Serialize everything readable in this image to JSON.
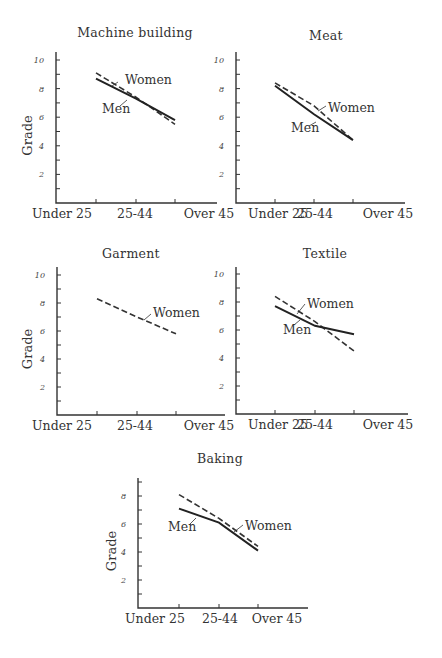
{
  "chart_data": [
    {
      "type": "line",
      "title": "Machine building",
      "xlabel": "",
      "ylabel": "Grade",
      "categories": [
        "Under 25",
        "25-44",
        "Over 45"
      ],
      "ylim": [
        0,
        10.5
      ],
      "yticks_labeled": [
        2,
        4,
        6,
        8,
        10
      ],
      "grid": false,
      "series": [
        {
          "name": "Women",
          "style": "dashed",
          "values": [
            9.1,
            7.4,
            5.5
          ]
        },
        {
          "name": "Men",
          "style": "solid",
          "values": [
            8.7,
            7.3,
            5.8
          ]
        }
      ]
    },
    {
      "type": "line",
      "title": "Meat",
      "xlabel": "",
      "ylabel": "",
      "categories": [
        "Under 25",
        "25-44",
        "Over 45"
      ],
      "ylim": [
        0,
        10.5
      ],
      "yticks_labeled": [
        2,
        4,
        6,
        8,
        10
      ],
      "grid": false,
      "series": [
        {
          "name": "Women",
          "style": "dashed",
          "values": [
            8.4,
            6.8,
            4.4
          ]
        },
        {
          "name": "Men",
          "style": "solid",
          "values": [
            8.2,
            6.2,
            4.4
          ]
        }
      ]
    },
    {
      "type": "line",
      "title": "Garment",
      "xlabel": "",
      "ylabel": "Grade",
      "categories": [
        "Under 25",
        "25-44",
        "Over 45"
      ],
      "ylim": [
        0,
        10.5
      ],
      "yticks_labeled": [
        2,
        4,
        6,
        8,
        10
      ],
      "grid": false,
      "series": [
        {
          "name": "Women",
          "style": "dashed",
          "values": [
            8.3,
            7.0,
            5.8
          ]
        }
      ]
    },
    {
      "type": "line",
      "title": "Textile",
      "xlabel": "",
      "ylabel": "",
      "categories": [
        "Under 25",
        "25-44",
        "Over 45"
      ],
      "ylim": [
        0,
        10.5
      ],
      "yticks_labeled": [
        2,
        4,
        6,
        8,
        10
      ],
      "grid": false,
      "series": [
        {
          "name": "Women",
          "style": "dashed",
          "values": [
            8.4,
            6.6,
            4.5
          ]
        },
        {
          "name": "Men",
          "style": "solid",
          "values": [
            7.7,
            6.3,
            5.7
          ]
        }
      ]
    },
    {
      "type": "line",
      "title": "Baking",
      "xlabel": "",
      "ylabel": "Grade",
      "categories": [
        "Under 25",
        "25-44",
        "Over 45"
      ],
      "ylim": [
        0,
        9.2
      ],
      "yticks_labeled": [
        2,
        4,
        6,
        8
      ],
      "grid": false,
      "series": [
        {
          "name": "Women",
          "style": "dashed",
          "values": [
            8.1,
            6.4,
            4.4
          ]
        },
        {
          "name": "Men",
          "style": "solid",
          "values": [
            7.1,
            6.1,
            4.1
          ]
        }
      ]
    }
  ],
  "layout": [
    {
      "x0": 56,
      "y0": 203,
      "xend": 217,
      "ytop": 52,
      "ppu": 14.3,
      "tickx": [
        96,
        136,
        175
      ],
      "xlabelx": [
        62,
        135,
        209
      ],
      "title_x": 135,
      "title_y": 37,
      "show_ylabel": true,
      "ylabel_x": 32,
      "labels": [
        {
          "series": "Women",
          "x": 125,
          "y": 84,
          "lx1": 112,
          "ly1": 86,
          "lx2": 118,
          "ly2": 82
        },
        {
          "series": "Men",
          "x": 102,
          "y": 113,
          "lx1": 120,
          "ly1": 106,
          "lx2": 127,
          "ly2": 100
        }
      ]
    },
    {
      "x0": 236,
      "y0": 203,
      "xend": 405,
      "ytop": 52,
      "ppu": 14.3,
      "tickx": [
        275,
        314,
        353
      ],
      "xlabelx": [
        278,
        315,
        388
      ],
      "title_x": 326,
      "title_y": 40,
      "show_ylabel": false,
      "labels": [
        {
          "series": "Women",
          "x": 328,
          "y": 112,
          "lx1": 318,
          "ly1": 111,
          "lx2": 326,
          "ly2": 106
        },
        {
          "series": "Men",
          "x": 291,
          "y": 132,
          "lx1": 309,
          "ly1": 126,
          "lx2": 316,
          "ly2": 122
        }
      ]
    },
    {
      "x0": 57,
      "y0": 415,
      "xend": 225,
      "ytop": 267,
      "ppu": 14.0,
      "tickx": [
        97,
        137,
        176
      ],
      "xlabelx": [
        62,
        135,
        209
      ],
      "title_x": 131,
      "title_y": 258,
      "show_ylabel": true,
      "ylabel_x": 32,
      "labels": [
        {
          "series": "Women",
          "x": 153,
          "y": 317,
          "lx1": 144,
          "ly1": 320,
          "lx2": 151,
          "ly2": 314
        }
      ]
    },
    {
      "x0": 236,
      "y0": 414,
      "xend": 408,
      "ytop": 267,
      "ppu": 14.0,
      "tickx": [
        275,
        315,
        354
      ],
      "xlabelx": [
        278,
        315,
        388
      ],
      "title_x": 325,
      "title_y": 258,
      "show_ylabel": false,
      "labels": [
        {
          "series": "Women",
          "x": 307,
          "y": 308,
          "lx1": 297,
          "ly1": 314,
          "lx2": 305,
          "ly2": 304
        },
        {
          "series": "Men",
          "x": 283,
          "y": 334,
          "lx1": 294,
          "ly1": 325,
          "lx2": 300,
          "ly2": 320
        }
      ]
    },
    {
      "x0": 138,
      "y0": 608,
      "xend": 308,
      "ytop": 478,
      "ppu": 14.0,
      "tickx": [
        179,
        219,
        258
      ],
      "xlabelx": [
        155,
        220,
        277
      ],
      "title_x": 220,
      "title_y": 463,
      "show_ylabel": true,
      "ylabel_x": 116,
      "labels": [
        {
          "series": "Women",
          "x": 245,
          "y": 530,
          "lx1": 234,
          "ly1": 532,
          "lx2": 243,
          "ly2": 525
        },
        {
          "series": "Men",
          "x": 168,
          "y": 531,
          "lx1": 190,
          "ly1": 524,
          "lx2": 196,
          "ly2": 518
        }
      ]
    }
  ]
}
